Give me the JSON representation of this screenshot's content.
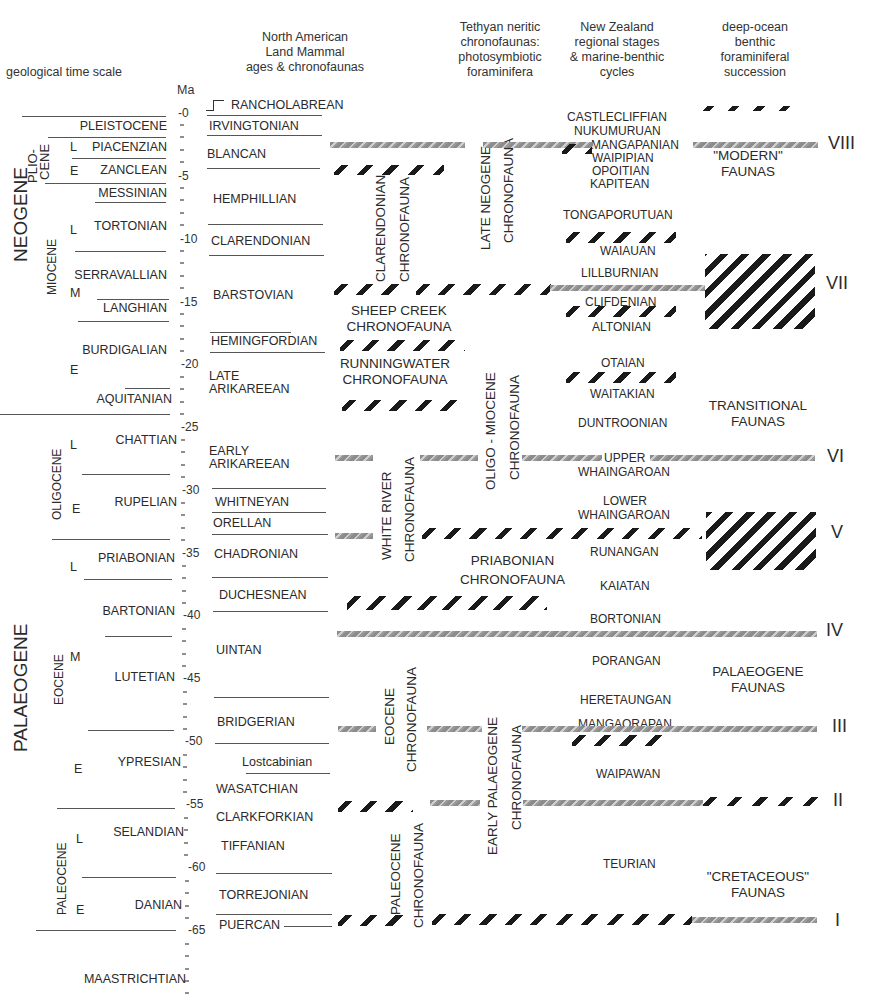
{
  "headers": {
    "time_scale": "geological time scale",
    "ma": "Ma",
    "nalma": [
      "North American",
      "Land Mammal",
      "ages & chronofaunas"
    ],
    "tethyan": [
      "Tethyan neritic",
      "chronofaunas:",
      "photosymbiotic",
      "foraminifera"
    ],
    "nz": [
      "New Zealand",
      "regional stages",
      "& marine-benthic",
      "cycles"
    ],
    "deep": [
      "deep-ocean",
      "benthic",
      "foraminiferal",
      "succession"
    ]
  },
  "periods": [
    "NEOGENE",
    "PALAEOGENE"
  ],
  "epochs": [
    "PLIO-",
    "CENE",
    "MIOCENE",
    "OLIGOCENE",
    "EOCENE",
    "PALEOCENE"
  ],
  "stages": [
    "PLEISTOCENE",
    "PIACENZIAN",
    "ZANCLEAN",
    "MESSINIAN",
    "TORTONIAN",
    "SERRAVALLIAN",
    "LANGHIAN",
    "BURDIGALIAN",
    "AQUITANIAN",
    "CHATTIAN",
    "RUPELIAN",
    "PRIABONIAN",
    "BARTONIAN",
    "LUTETIAN",
    "YPRESIAN",
    "SELANDIAN",
    "DANIAN",
    "MAASTRICHTIAN"
  ],
  "subdivisions": [
    "L",
    "E",
    "L",
    "M",
    "E",
    "L",
    "E",
    "L",
    "M",
    "E",
    "L",
    "E"
  ],
  "ticks": [
    "0",
    "5",
    "10",
    "15",
    "20",
    "25",
    "30",
    "35",
    "40",
    "45",
    "50",
    "55",
    "60",
    "65"
  ],
  "nalma": [
    "RANCHOLABREAN",
    "IRVINGTONIAN",
    "BLANCAN",
    "HEMPHILLIAN",
    "CLARENDONIAN",
    "BARSTOVIAN",
    "HEMINGFORDIAN",
    "LATE",
    "ARIKAREEAN",
    "EARLY",
    "ARIKAREEAN",
    "WHITNEYAN",
    "ORELLAN",
    "CHADRONIAN",
    "DUCHESNEAN",
    "UINTAN",
    "BRIDGERIAN",
    "Lostcabinian",
    "WASATCHIAN",
    "CLARKFORKIAN",
    "TIFFANIAN",
    "TORREJONIAN",
    "PUERCAN"
  ],
  "chronofaunas": {
    "clarendonian": [
      "CLARENDONIAN",
      "CHRONOFAUNA"
    ],
    "sheep_creek": [
      "SHEEP CREEK",
      "CHRONOFAUNA"
    ],
    "runningwater": [
      "RUNNINGWATER",
      "CHRONOFAUNA"
    ],
    "white_river": [
      "WHITE    RIVER",
      "CHRONOFAUNA"
    ],
    "eocene": [
      "EOCENE",
      "CHRONOFAUNA"
    ],
    "paleocene": [
      "PALEOCENE",
      "CHRONOFAUNA"
    ],
    "late_neogene": [
      "LATE    NEOGENE",
      "CHRONOFAUNA"
    ],
    "oligo_miocene": [
      "OLIGO - MIOCENE",
      "CHRONOFAUNA"
    ],
    "priabonian": [
      "PRIABONIAN",
      "CHRONOFAUNA"
    ],
    "early_palaeogene": [
      "EARLY    PALAEOGENE",
      "CHRONOFAUNA"
    ]
  },
  "nz_stages": [
    "CASTLECLIFFIAN",
    "NUKUMURUAN",
    "MANGAPANIAN",
    "WAIPIPIAN",
    "OPOITIAN",
    "KAPITEAN",
    "TONGAPORUTUAN",
    "WAIAUAN",
    "LILLBURNIAN",
    "CLIFDENIAN",
    "ALTONIAN",
    "OTAIAN",
    "WAITAKIAN",
    "DUNTROONIAN",
    "UPPER",
    "WHAINGAROAN",
    "LOWER",
    "WHAINGAROAN",
    "RUNANGAN",
    "KAIATAN",
    "BORTONIAN",
    "PORANGAN",
    "HERETAUNGAN",
    "MANGAORAPAN",
    "WAIPAWAN",
    "TEURIAN"
  ],
  "deep_faunas": {
    "modern": [
      "\"MODERN\"",
      "FAUNAS"
    ],
    "transitional": [
      "TRANSITIONAL",
      "FAUNAS"
    ],
    "palaeogene": [
      "PALAEOGENE",
      "FAUNAS"
    ],
    "cretaceous": [
      "\"CRETACEOUS\"",
      "FAUNAS"
    ]
  },
  "cycles": [
    "VIII",
    "VII",
    "VI",
    "V",
    "IV",
    "III",
    "II",
    "I"
  ]
}
